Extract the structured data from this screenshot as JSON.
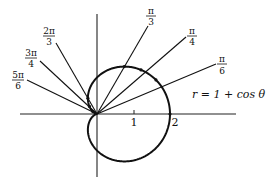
{
  "diagram": {
    "equation_label": "r = 1 + cos θ",
    "axis_ticks": [
      {
        "value": 1,
        "label": "1"
      },
      {
        "value": 2,
        "label": "2"
      }
    ],
    "rays": [
      {
        "angle": "π/6",
        "num": "π",
        "den": "6",
        "theta_deg": 30
      },
      {
        "angle": "π/4",
        "num": "π",
        "den": "4",
        "theta_deg": 45
      },
      {
        "angle": "π/3",
        "num": "π",
        "den": "3",
        "theta_deg": 60
      },
      {
        "angle": "2π/3",
        "num": "2π",
        "den": "3",
        "theta_deg": 120
      },
      {
        "angle": "3π/4",
        "num": "3π",
        "den": "4",
        "theta_deg": 135
      },
      {
        "angle": "5π/6",
        "num": "5π",
        "den": "6",
        "theta_deg": 150
      }
    ],
    "curve": {
      "type": "polar",
      "r": "1 + cos θ",
      "color": "#111111"
    },
    "colors": {
      "line": "#111111",
      "background": "#ffffff"
    }
  }
}
